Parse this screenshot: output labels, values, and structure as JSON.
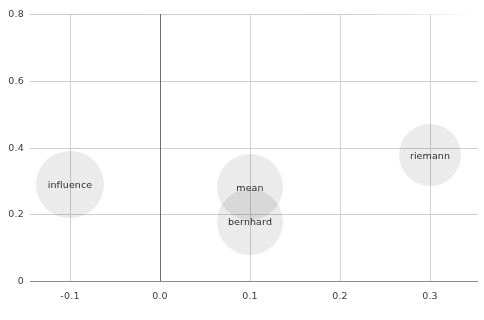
{
  "chart_data": {
    "type": "scatter",
    "title": "",
    "subtitle": "",
    "xlabel": "",
    "ylabel": "",
    "xlim": [
      -0.155,
      0.36
    ],
    "ylim": [
      0,
      0.8
    ],
    "xticks": [
      "-0.1",
      "0.0",
      "0.1",
      "0.2",
      "0.3"
    ],
    "xtick_values": [
      -0.1,
      0.0,
      0.1,
      0.2,
      0.3
    ],
    "yticks": [
      "0",
      "0.2",
      "0.4",
      "0.6",
      "0.8"
    ],
    "ytick_values": [
      0,
      0.2,
      0.4,
      0.6,
      0.8
    ],
    "grid": true,
    "legend": "none",
    "bubble_color": "#ebebeb",
    "grid_color": "#cfcfcf",
    "axis_color": "#6e6e6e",
    "label_color": "#2b2b2b",
    "points": [
      {
        "label": "influence",
        "x": -0.1,
        "y": 0.29,
        "r": 0.101
      },
      {
        "label": "mean",
        "x": 0.1,
        "y": 0.281,
        "r": 0.099
      },
      {
        "label": "bernhard",
        "x": 0.1,
        "y": 0.177,
        "r": 0.099
      },
      {
        "label": "riemann",
        "x": 0.3,
        "y": 0.377,
        "r": 0.093
      }
    ]
  }
}
